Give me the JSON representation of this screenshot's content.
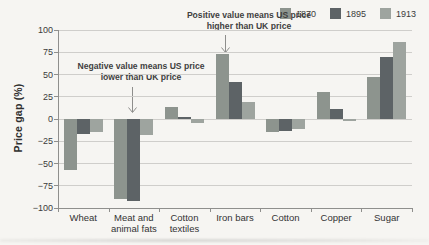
{
  "figure": {
    "y_axis_title": "Price gap (%)",
    "annotation_positive": "Positive value means US price higher than UK price",
    "annotation_negative": "Negative value means US price lower than UK price"
  },
  "chart_data": {
    "type": "bar",
    "title": "",
    "xlabel": "",
    "ylabel": "Price gap (%)",
    "ylim": [
      -100,
      100
    ],
    "yticks": [
      100,
      75,
      50,
      25,
      0,
      -25,
      -50,
      -75,
      -100
    ],
    "grid": true,
    "legend_position": "top-right",
    "categories": [
      "Wheat",
      "Meat and animal fats",
      "Cotton textiles",
      "Iron bars",
      "Cotton",
      "Copper",
      "Sugar"
    ],
    "series": [
      {
        "name": "1870",
        "color": "#8d948e",
        "values": [
          -57,
          -90,
          13,
          73,
          -15,
          30,
          47
        ]
      },
      {
        "name": "1895",
        "color": "#5d6366",
        "values": [
          -17,
          -92,
          2,
          42,
          -13,
          11,
          70
        ]
      },
      {
        "name": "1913",
        "color": "#9ea49f",
        "values": [
          -15,
          -18,
          -4,
          19,
          -11,
          -2,
          86
        ]
      }
    ],
    "annotations": [
      "Positive value means US price higher than UK price",
      "Negative value means US price lower than UK price"
    ]
  }
}
